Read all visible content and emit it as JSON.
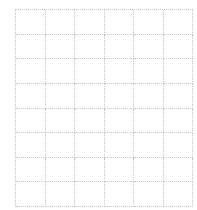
{
  "grid": {
    "columns": 6,
    "rows": 8,
    "line_color": "#c4c4c4",
    "line_style": "dotted",
    "cells": [
      [
        "",
        "",
        "",
        "",
        "",
        ""
      ],
      [
        "",
        "",
        "",
        "",
        "",
        ""
      ],
      [
        "",
        "",
        "",
        "",
        "",
        ""
      ],
      [
        "",
        "",
        "",
        "",
        "",
        ""
      ],
      [
        "",
        "",
        "",
        "",
        "",
        ""
      ],
      [
        "",
        "",
        "",
        "",
        "",
        ""
      ],
      [
        "",
        "",
        "",
        "",
        "",
        ""
      ],
      [
        "",
        "",
        "",
        "",
        "",
        ""
      ]
    ]
  }
}
